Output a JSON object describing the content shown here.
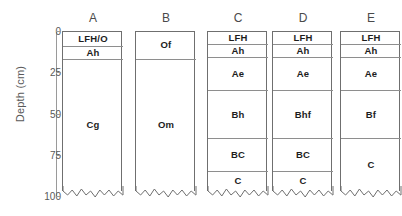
{
  "axis": {
    "label": "Depth (cm)",
    "ticks": [
      {
        "value": 0,
        "label": "0"
      },
      {
        "value": 25,
        "label": "25"
      },
      {
        "value": 50,
        "label": "50"
      },
      {
        "value": 75,
        "label": "75"
      },
      {
        "value": 100,
        "label": "100"
      }
    ],
    "range": [
      0,
      100
    ],
    "units": "cm",
    "color": "#595959"
  },
  "style": {
    "border_color": "#6f6f6f",
    "divider_color": "#8e8e8e",
    "text_color": "#1d1d1d",
    "background": "#ffffff"
  },
  "chart_data": {
    "type": "table",
    "title": "",
    "xlabel": "",
    "ylabel": "Depth (cm)",
    "ylim": [
      0,
      100
    ],
    "y_inverted": true,
    "grid": false,
    "legend": "none",
    "categories": [
      "A",
      "B",
      "C",
      "D",
      "E"
    ],
    "series": [
      {
        "name": "A",
        "header": "A",
        "horizons": [
          {
            "label": "LFH/O",
            "top": 0,
            "bottom": 9
          },
          {
            "label": "Ah",
            "top": 9,
            "bottom": 17
          },
          {
            "label": "Cg",
            "top": 17,
            "bottom": 100
          }
        ]
      },
      {
        "name": "B",
        "header": "B",
        "horizons": [
          {
            "label": "Of",
            "top": 0,
            "bottom": 17
          },
          {
            "label": "Om",
            "top": 17,
            "bottom": 100
          }
        ]
      },
      {
        "name": "C",
        "header": "C",
        "horizons": [
          {
            "label": "LFH",
            "top": 0,
            "bottom": 8
          },
          {
            "label": "Ah",
            "top": 8,
            "bottom": 16
          },
          {
            "label": "Ae",
            "top": 16,
            "bottom": 36
          },
          {
            "label": "Bh",
            "top": 36,
            "bottom": 65
          },
          {
            "label": "BC",
            "top": 65,
            "bottom": 85
          },
          {
            "label": "C",
            "top": 85,
            "bottom": 100
          }
        ]
      },
      {
        "name": "D",
        "header": "D",
        "horizons": [
          {
            "label": "LFH",
            "top": 0,
            "bottom": 8
          },
          {
            "label": "Ah",
            "top": 8,
            "bottom": 16
          },
          {
            "label": "Ae",
            "top": 16,
            "bottom": 36
          },
          {
            "label": "Bhf",
            "top": 36,
            "bottom": 65
          },
          {
            "label": "BC",
            "top": 65,
            "bottom": 85
          },
          {
            "label": "C",
            "top": 85,
            "bottom": 100
          }
        ]
      },
      {
        "name": "E",
        "header": "E",
        "horizons": [
          {
            "label": "LFH",
            "top": 0,
            "bottom": 8
          },
          {
            "label": "Ah",
            "top": 8,
            "bottom": 16
          },
          {
            "label": "Ae",
            "top": 16,
            "bottom": 36
          },
          {
            "label": "Bf",
            "top": 36,
            "bottom": 65
          },
          {
            "label": "C",
            "top": 65,
            "bottom": 100
          }
        ]
      }
    ]
  }
}
